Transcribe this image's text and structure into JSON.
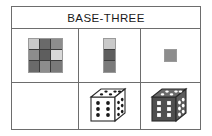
{
  "table": {
    "title": "BASE-THREE",
    "columns": 3,
    "rows": 2
  },
  "colors": {
    "frame_border": "#6d6d6d",
    "cell_border": "#3c3c3c",
    "tile_outline": "#9a9a9a",
    "text": "#1a1a1a",
    "page_background": "#ffffff",
    "light_gray": "#c9c9c9",
    "medium_gray": "#8d8d8d",
    "dark_gray": "#5e5e5e",
    "pale_gray": "#d9d9d9",
    "die_white_face": "#ffffff",
    "die_white_outline": "#2a2a2a",
    "die_white_pip": "#1a1a1a",
    "die_dark_face": "#4f4f4f",
    "die_dark_top": "#6a6a6a",
    "die_dark_side": "#5c5c5c",
    "die_dark_pip": "#ffffff",
    "die_dark_outline": "#2a2a2a"
  },
  "cells": {
    "r1c1": {
      "name": "nine-grid",
      "type": "3x3-grid",
      "swatches": [
        "#c9c9c9",
        "#6a6a6a",
        "#8d8d8d",
        "#8d8d8d",
        "#5e5e5e",
        "#d9d9d9",
        "#6a6a6a",
        "#8d8d8d",
        "#7a7a7a"
      ]
    },
    "r1c2": {
      "name": "three-strip",
      "type": "1x3-strip",
      "swatches": [
        "#c9c9c9",
        "#5e5e5e",
        "#7a7a7a"
      ]
    },
    "r1c3": {
      "name": "single-square",
      "type": "1x1-square",
      "swatches": [
        "#8d8d8d"
      ]
    },
    "r2c1": {
      "name": "empty-cell",
      "type": "empty",
      "content": ""
    },
    "r2c2": {
      "name": "white-die",
      "type": "die",
      "style": "white",
      "front_face_pips": 6,
      "right_face_pips": 6,
      "top_face_pips": 6
    },
    "r2c3": {
      "name": "dark-die",
      "type": "die",
      "style": "dark",
      "front_face_pips": 6,
      "right_face_pips": 6,
      "top_face_pips": 6
    }
  }
}
